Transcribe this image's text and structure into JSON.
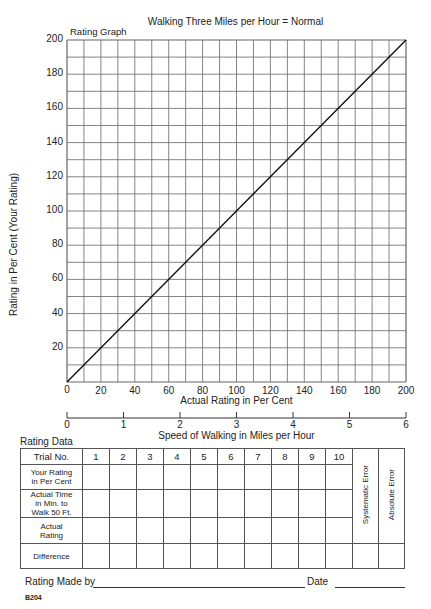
{
  "header": {
    "title": "Walking Three Miles per Hour = Normal",
    "graph_label": "Rating Graph"
  },
  "chart_data": {
    "type": "line",
    "title": "Walking Three Miles per Hour = Normal",
    "subtitle": "Rating Graph",
    "xlabel": "Actual Rating in Per Cent",
    "ylabel": "Rating in Per Cent (Your Rating)",
    "secondary_xlabel": "Speed of Walking in Miles per Hour",
    "xlim": [
      0,
      200
    ],
    "ylim": [
      0,
      200
    ],
    "grid": true,
    "grid_step": 10,
    "x_ticks": [
      "0",
      "20",
      "40",
      "60",
      "80",
      "100",
      "120",
      "140",
      "160",
      "180",
      "200"
    ],
    "y_ticks": [
      "20",
      "40",
      "60",
      "80",
      "100",
      "120",
      "140",
      "160",
      "180",
      "200"
    ],
    "y_origin_label": "0",
    "secondary_x_ticks": [
      "0",
      "1",
      "2",
      "3",
      "4",
      "5",
      "6"
    ],
    "series": [
      {
        "name": "Reference line (Your Rating = Actual Rating)",
        "x": [
          0,
          200
        ],
        "y": [
          0,
          200
        ]
      }
    ]
  },
  "axes": {
    "xlabel": "Actual Rating in Per Cent",
    "ylabel": "Rating in Per Cent (Your Rating)",
    "speed_label": "Speed of Walking in Miles per Hour"
  },
  "table": {
    "section_label": "Rating Data",
    "header_label": "Trial No.",
    "trials": [
      "1",
      "2",
      "3",
      "4",
      "5",
      "6",
      "7",
      "8",
      "9",
      "10"
    ],
    "rows": [
      {
        "label": "Your Rating in Per Cent",
        "lines": [
          "Your Rating",
          "in Per Cent"
        ]
      },
      {
        "label": "Actual Time in Min. to Walk 50 Ft.",
        "lines": [
          "Actual Time",
          "in Min. to",
          "Walk 50 Ft."
        ]
      },
      {
        "label": "Actual Rating",
        "lines": [
          "Actual",
          "Rating"
        ]
      },
      {
        "label": "Difference",
        "lines": [
          "Difference"
        ]
      }
    ],
    "systematic_error": "Systematic Error",
    "absolute_error": "Absolute Error"
  },
  "footer": {
    "rating_made_by": "Rating Made by",
    "date": "Date",
    "form_number": "B204"
  }
}
